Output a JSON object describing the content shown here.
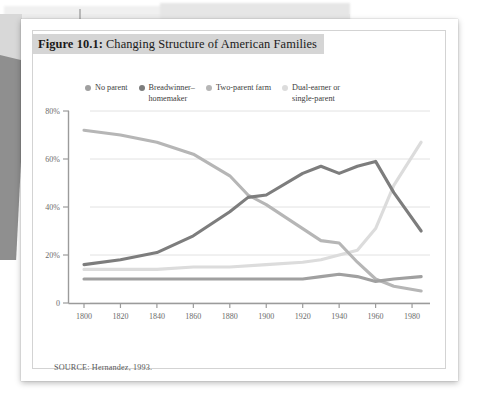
{
  "figure": {
    "label": "Figure 10.1:",
    "title": " Changing Structure of American Families",
    "source": "SOURCE: Hernandez, 1993."
  },
  "legend": {
    "items": [
      {
        "label": "No parent",
        "color": "#a0a0a0",
        "series_key": "no_parent"
      },
      {
        "label": "Breadwinner–\nhomemaker",
        "color": "#7d7d7d",
        "series_key": "breadwinner_homemaker"
      },
      {
        "label": "Two-parent farm",
        "color": "#b6b6b6",
        "series_key": "two_parent_farm"
      },
      {
        "label": "Dual-earner or\nsingle-parent",
        "color": "#dcdcdc",
        "series_key": "dual_earner_single_parent"
      }
    ]
  },
  "chart_data": {
    "type": "line",
    "title": "Changing Structure of American Families",
    "xlabel": "",
    "ylabel": "",
    "xlim": [
      1795,
      1990
    ],
    "ylim": [
      0,
      80
    ],
    "xticks": [
      1800,
      1820,
      1840,
      1860,
      1880,
      1900,
      1920,
      1940,
      1960,
      1980
    ],
    "xticklabels": [
      "1800",
      "1820",
      "1840",
      "1860",
      "1880",
      "1900",
      "1920",
      "1940",
      "1960",
      "1980"
    ],
    "yticks": [
      0,
      20,
      40,
      60,
      80
    ],
    "yticklabels": [
      "0",
      "20%",
      "40%",
      "60%",
      "80%"
    ],
    "grid": "horizontal",
    "legend_position": "top",
    "series": [
      {
        "name": "Two-parent farm",
        "color": "#b6b6b6",
        "x": [
          1800,
          1820,
          1840,
          1860,
          1880,
          1890,
          1900,
          1920,
          1930,
          1940,
          1950,
          1960,
          1970,
          1985
        ],
        "values": [
          72,
          70,
          67,
          62,
          53,
          45,
          41,
          31,
          26,
          25,
          17,
          10,
          7,
          5
        ]
      },
      {
        "name": "Breadwinner–homemaker",
        "color": "#7d7d7d",
        "x": [
          1800,
          1820,
          1840,
          1860,
          1880,
          1890,
          1900,
          1920,
          1930,
          1940,
          1950,
          1960,
          1970,
          1985
        ],
        "values": [
          16,
          18,
          21,
          28,
          38,
          44,
          45,
          54,
          57,
          54,
          57,
          59,
          46,
          30
        ]
      },
      {
        "name": "Dual-earner or single-parent",
        "color": "#dcdcdc",
        "x": [
          1800,
          1820,
          1840,
          1860,
          1880,
          1900,
          1920,
          1930,
          1940,
          1950,
          1960,
          1970,
          1985
        ],
        "values": [
          14,
          14,
          14,
          15,
          15,
          16,
          17,
          18,
          20,
          22,
          31,
          49,
          67
        ]
      },
      {
        "name": "No parent",
        "color": "#a0a0a0",
        "x": [
          1800,
          1820,
          1840,
          1860,
          1880,
          1900,
          1920,
          1930,
          1940,
          1950,
          1960,
          1970,
          1985
        ],
        "values": [
          10,
          10,
          10,
          10,
          10,
          10,
          10,
          11,
          12,
          11,
          9,
          10,
          11
        ]
      }
    ]
  }
}
